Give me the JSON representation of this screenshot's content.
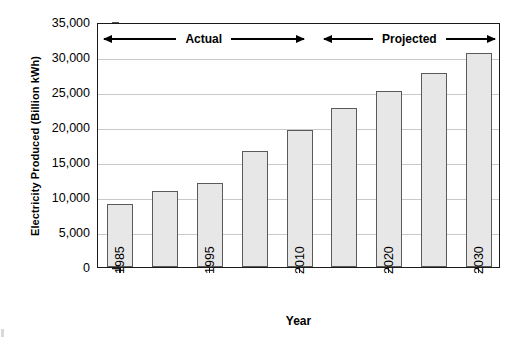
{
  "chart_data": {
    "type": "bar",
    "title": "",
    "xlabel": "Year",
    "ylabel": "Electricity Produced (Billion kWh)",
    "categories": [
      "1985",
      "",
      "1995",
      "",
      "2010",
      "",
      "2020",
      "",
      "2030"
    ],
    "values": [
      9000,
      10800,
      12000,
      16600,
      19600,
      22700,
      25100,
      27700,
      30600
    ],
    "ylim": [
      0,
      35000
    ],
    "ytick_labels": [
      "0",
      "5,000",
      "10,000",
      "15,000",
      "20,000",
      "25,000",
      "30,000",
      "35,000"
    ],
    "ytick_values": [
      0,
      5000,
      10000,
      15000,
      20000,
      25000,
      30000,
      35000
    ],
    "xtick_labels": [
      "1985",
      "1995",
      "2010",
      "2020",
      "2030"
    ],
    "xtick_bar_index": [
      0,
      2,
      4,
      6,
      8
    ],
    "grid": "horizontal",
    "legend_position": "none",
    "annotations": [
      {
        "label": "Actual",
        "start_fraction": 0.0,
        "end_fraction": 0.525
      },
      {
        "label": "Projected",
        "start_fraction": 0.545,
        "end_fraction": 1.0
      }
    ],
    "style": {
      "bar_fill": "#e7e7e7",
      "bar_border": "#5a5a5a",
      "axis_color": "#1a1a1a",
      "grid_color": "#c9c9c9",
      "background": "#ffffff"
    }
  }
}
